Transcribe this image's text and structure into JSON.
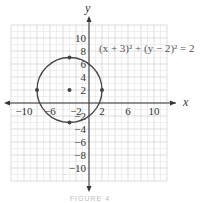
{
  "chart_data": {
    "type": "scatter",
    "title": "",
    "xlabel": "x",
    "ylabel": "y",
    "xlim": [
      -12,
      12
    ],
    "ylim": [
      -12,
      12
    ],
    "grid": true,
    "grid_step": 2,
    "x_ticks": [
      -10,
      -6,
      -2,
      2,
      6,
      10
    ],
    "x_tick_labels": [
      "−10",
      "−6",
      "−2",
      "2",
      "6",
      "10"
    ],
    "y_ticks": [
      10,
      8,
      6,
      4,
      2,
      -2,
      -4,
      -6,
      -8,
      -10
    ],
    "y_tick_labels": [
      "10",
      "8",
      "6",
      "4",
      "2",
      "−2",
      "−4",
      "−6",
      "−8",
      "−10"
    ],
    "annotation": "(x + 3)² + (y − 2)² = 2",
    "circle": {
      "center": [
        -3,
        2
      ],
      "radius": 5
    },
    "points": [
      {
        "x": -3,
        "y": 2,
        "label": "center"
      },
      {
        "x": -8,
        "y": 2
      },
      {
        "x": 2,
        "y": 2
      },
      {
        "x": -3,
        "y": 7
      },
      {
        "x": -3,
        "y": -3
      }
    ]
  },
  "caption": "FIGURE 4"
}
